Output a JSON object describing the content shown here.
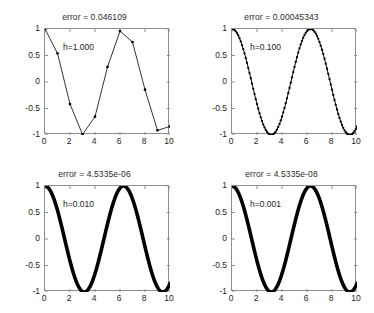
{
  "figure": {
    "background": "#ffffff",
    "axis_color": "#8d8d8d",
    "curve_color": "#000000",
    "rows": 2,
    "cols": 2
  },
  "chart_data": [
    {
      "type": "line",
      "title": "error = 0.046109",
      "annotation": "h=1.000",
      "xlabel": "",
      "ylabel": "",
      "xlim": [
        0,
        10
      ],
      "ylim": [
        -1,
        1
      ],
      "xticks": [
        0,
        2,
        4,
        6,
        8,
        10
      ],
      "xticklabels": [
        "0",
        "2",
        "4",
        "6",
        "8",
        "10"
      ],
      "yticks": [
        1,
        0.5,
        0,
        -0.5,
        -1
      ],
      "yticklabels": [
        "1",
        "0.5",
        "0",
        "-0.5",
        "-1"
      ],
      "grid": false,
      "legend": null,
      "marker": "point",
      "linewidth": 0.8,
      "step": 1.0,
      "x": [
        0,
        1,
        2,
        3,
        4,
        5,
        6,
        7,
        8,
        9,
        10
      ],
      "values": [
        1.0,
        0.5403,
        -0.4161,
        -0.99,
        -0.6536,
        0.2837,
        0.9602,
        0.7539,
        -0.1455,
        -0.9111,
        -0.8391
      ]
    },
    {
      "type": "line",
      "title": "error = 0.00045343",
      "annotation": "h=0.100",
      "xlabel": "",
      "ylabel": "",
      "xlim": [
        0,
        10
      ],
      "ylim": [
        -1,
        1
      ],
      "xticks": [
        0,
        2,
        4,
        6,
        8,
        10
      ],
      "xticklabels": [
        "0",
        "2",
        "4",
        "6",
        "8",
        "10"
      ],
      "yticks": [
        1,
        0.5,
        0,
        -0.5,
        -1
      ],
      "yticklabels": [
        "1",
        "0.5",
        "0",
        "-0.5",
        "-1"
      ],
      "grid": false,
      "legend": null,
      "marker": "point-dense",
      "linewidth": 1.0,
      "step": 0.1,
      "function": "cos(x)"
    },
    {
      "type": "line",
      "title": "error = 4.5335e-06",
      "annotation": "h=0.010",
      "xlabel": "",
      "ylabel": "",
      "xlim": [
        0,
        10
      ],
      "ylim": [
        -1,
        1
      ],
      "xticks": [
        0,
        2,
        4,
        6,
        8,
        10
      ],
      "xticklabels": [
        "0",
        "2",
        "4",
        "6",
        "8",
        "10"
      ],
      "yticks": [
        1,
        0.5,
        0,
        -0.5,
        -1
      ],
      "yticklabels": [
        "1",
        "0.5",
        "0",
        "-0.5",
        "-1"
      ],
      "grid": false,
      "legend": null,
      "marker": "none",
      "linewidth": 3.6,
      "step": 0.01,
      "function": "cos(x)"
    },
    {
      "type": "line",
      "title": "error = 4.5335e-08",
      "annotation": "h=0.001",
      "xlabel": "",
      "ylabel": "",
      "xlim": [
        0,
        10
      ],
      "ylim": [
        -1,
        1
      ],
      "xticks": [
        0,
        2,
        4,
        6,
        8,
        10
      ],
      "xticklabels": [
        "0",
        "2",
        "4",
        "6",
        "8",
        "10"
      ],
      "yticks": [
        1,
        0.5,
        0,
        -0.5,
        -1
      ],
      "yticklabels": [
        "1",
        "0.5",
        "0",
        "-0.5",
        "-1"
      ],
      "grid": false,
      "legend": null,
      "marker": "none",
      "linewidth": 3.6,
      "step": 0.001,
      "function": "cos(x)"
    }
  ]
}
